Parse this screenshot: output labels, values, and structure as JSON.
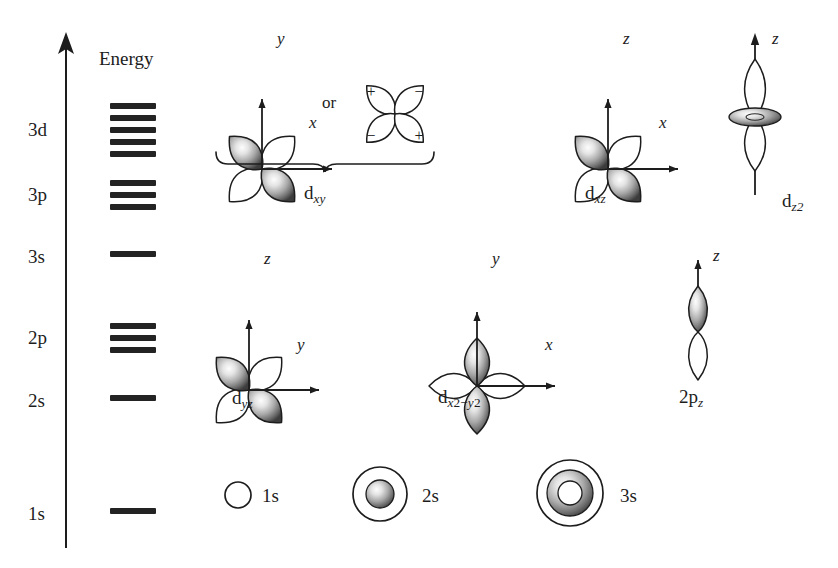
{
  "figure": {
    "background_color": "#ffffff",
    "ink_color": "#1d1d1d"
  },
  "axis": {
    "label": "Energy",
    "direction": "up",
    "x": 66,
    "top": 40,
    "bottom": 548
  },
  "energy_levels": [
    {
      "label": "3d",
      "label_x": 28,
      "label_y": 130,
      "sublevel_count": 5,
      "bar_top": 103,
      "bar_spacing": 12
    },
    {
      "label": "3p",
      "label_x": 28,
      "label_y": 194,
      "sublevel_count": 3,
      "bar_top": 180,
      "bar_spacing": 12
    },
    {
      "label": "3s",
      "label_x": 28,
      "label_y": 256,
      "sublevel_count": 1,
      "bar_top": 251,
      "bar_spacing": 12
    },
    {
      "label": "2p",
      "label_x": 28,
      "label_y": 337,
      "sublevel_count": 3,
      "bar_top": 323,
      "bar_spacing": 12
    },
    {
      "label": "2s",
      "label_x": 28,
      "label_y": 400,
      "sublevel_count": 1,
      "bar_top": 395,
      "bar_spacing": 12
    },
    {
      "label": "1s",
      "label_x": 28,
      "label_y": 513,
      "sublevel_count": 1,
      "bar_top": 508,
      "bar_spacing": 12
    }
  ],
  "bar_geometry": {
    "x": 110,
    "width": 46,
    "height": 6
  },
  "orbitals": [
    {
      "id": "dxy-shaded",
      "type": "d-cloverleaf-diagonal",
      "label": "d",
      "label_sub": "xy",
      "axes": {
        "vertical": "y",
        "horizontal": "x"
      },
      "shaded_lobes": "upper-left, lower-right",
      "center_x": 262,
      "center_y": 103
    },
    {
      "id": "dxy-signs",
      "type": "d-cloverleaf-signs",
      "signs": [
        "+",
        "−",
        "−",
        "+"
      ],
      "center_x": 395,
      "center_y": 108
    },
    {
      "id": "dxz",
      "type": "d-cloverleaf-diagonal",
      "label": "d",
      "label_sub": "xz",
      "axes": {
        "vertical": "z",
        "horizontal": "x"
      },
      "shaded_lobes": "upper-left, lower-right",
      "center_x": 608,
      "center_y": 103
    },
    {
      "id": "dz2",
      "type": "d-z2",
      "label": "d",
      "label_sub": "z2",
      "axes": {
        "vertical": "z"
      },
      "center_x": 755,
      "center_y": 115
    },
    {
      "id": "dyz",
      "type": "d-cloverleaf-diagonal",
      "label": "d",
      "label_sub": "yz",
      "axes": {
        "vertical": "z",
        "horizontal": "y"
      },
      "shaded_lobes": "upper-left, lower-right",
      "center_x": 249,
      "center_y": 324
    },
    {
      "id": "dx2-y2",
      "type": "d-cloverleaf-axial",
      "label": "d",
      "label_sub_a": "x",
      "label_sup_a": "2",
      "label_sub_b": "y",
      "label_sup_b": "2",
      "axes": {
        "vertical": "y",
        "horizontal": "x"
      },
      "shaded_lobes": "top, bottom",
      "center_x": 477,
      "center_y": 324
    },
    {
      "id": "2pz",
      "type": "p-orbital",
      "label": "2p",
      "label_sub": "z",
      "axes": {
        "vertical": "z"
      },
      "shaded_lobes": "top",
      "center_x": 698,
      "center_y": 330
    }
  ],
  "brace": {
    "covers": [
      "dxy-shaded",
      "dxy-signs"
    ],
    "label": "d",
    "label_sub": "xy",
    "left": 218,
    "right": 428,
    "y": 156
  },
  "connector_text": {
    "label": "or",
    "x": 322,
    "y": 102
  },
  "axis_labels": [
    {
      "text": "y",
      "x": 277,
      "y": 36
    },
    {
      "text": "x",
      "x": 310,
      "y": 124
    },
    {
      "text": "z",
      "x": 623,
      "y": 36
    },
    {
      "text": "x",
      "x": 660,
      "y": 124
    },
    {
      "text": "z",
      "x": 772,
      "y": 36
    },
    {
      "text": "z",
      "x": 264,
      "y": 256
    },
    {
      "text": "y",
      "x": 297,
      "y": 345
    },
    {
      "text": "y",
      "x": 492,
      "y": 256
    },
    {
      "text": "x",
      "x": 545,
      "y": 345
    },
    {
      "text": "z",
      "x": 713,
      "y": 253
    }
  ],
  "s_orbitals": [
    {
      "id": "1s",
      "label": "1s",
      "type": "open-circle",
      "center_x": 238,
      "center_y": 495,
      "outer_r": 13,
      "shells": 1
    },
    {
      "id": "2s",
      "label": "2s",
      "type": "shell-with-core",
      "center_x": 380,
      "center_y": 494,
      "outer_r": 27,
      "inner_r": 14,
      "shells": 2
    },
    {
      "id": "3s",
      "label": "3s",
      "type": "shell-with-ring-core",
      "center_x": 570,
      "center_y": 493,
      "outer_r": 33,
      "mid_r": 23,
      "inner_r": 12,
      "shells": 3
    }
  ],
  "orbital_captions": [
    {
      "for": "dxz",
      "x": 585,
      "y": 192
    },
    {
      "for": "dz2",
      "x": 782,
      "y": 200
    },
    {
      "for": "dyz",
      "x": 232,
      "y": 397
    },
    {
      "for": "dx2-y2",
      "x": 438,
      "y": 396
    },
    {
      "for": "2pz",
      "x": 679,
      "y": 396
    }
  ]
}
